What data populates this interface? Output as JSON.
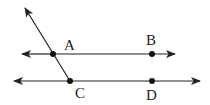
{
  "diagram": {
    "type": "geometry-parallel-lines-transversal",
    "colors": {
      "line": "#222222",
      "point": "#111111",
      "background": "#ffffff"
    },
    "points": [
      {
        "label": "A",
        "x": 53,
        "y": 54,
        "lx": 62,
        "ly": 48
      },
      {
        "label": "B",
        "x": 152,
        "y": 54,
        "lx": 146,
        "ly": 44
      },
      {
        "label": "C",
        "x": 70,
        "y": 81,
        "lx": 75,
        "ly": 99
      },
      {
        "label": "D",
        "x": 152,
        "y": 81,
        "lx": 146,
        "ly": 101
      }
    ],
    "lines": [
      {
        "name": "line-AB",
        "x1": 22,
        "y1": 54,
        "x2": 175,
        "y2": 54
      },
      {
        "name": "line-CD",
        "x1": 14,
        "y1": 81,
        "x2": 200,
        "y2": 81
      },
      {
        "name": "ray-CA",
        "x1": 70,
        "y1": 81,
        "x2": 25,
        "y2": 8
      }
    ]
  }
}
